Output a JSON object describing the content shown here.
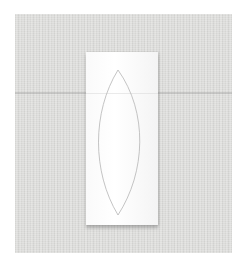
{
  "scene": {
    "description": "White paper rectangle with a pencil-drawn lens/leaf outline, lying on beige-gray linen fabric",
    "colors": {
      "border": "#ffffff",
      "fabric": "#dcdcda",
      "paper": "#fafafa",
      "outline": "#b5b5b5"
    },
    "elements": {
      "fabric": "linen-background",
      "paper": "paper-sheet",
      "outline": "lens-shape-outline"
    }
  }
}
